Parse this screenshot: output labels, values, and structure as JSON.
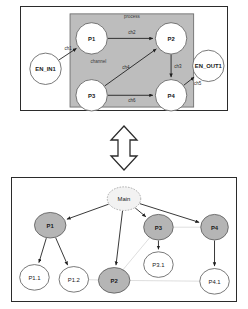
{
  "top_diagram": {
    "name": "process-channel-diagram",
    "region_labels": [
      {
        "id": "process",
        "text": "process",
        "x": 112,
        "y": 10
      },
      {
        "id": "channel",
        "text": "channel",
        "x": 78,
        "y": 56
      }
    ],
    "nodes": [
      {
        "id": "EN_IN1",
        "label": "EN_IN1",
        "x": 24,
        "y": 63,
        "r": 16,
        "style": "white"
      },
      {
        "id": "P1",
        "label": "P1",
        "x": 71,
        "y": 32,
        "r": 16,
        "style": "white"
      },
      {
        "id": "P2",
        "label": "P2",
        "x": 152,
        "y": 32,
        "r": 16,
        "style": "white"
      },
      {
        "id": "P3",
        "label": "P3",
        "x": 71,
        "y": 90,
        "r": 16,
        "style": "white"
      },
      {
        "id": "P4",
        "label": "P4",
        "x": 152,
        "y": 90,
        "r": 16,
        "style": "white"
      },
      {
        "id": "EN_OUT1",
        "label": "EN_OUT1",
        "x": 190,
        "y": 60,
        "r": 16,
        "style": "white"
      }
    ],
    "edges": [
      {
        "id": "ch1",
        "label": "ch1",
        "from": "EN_IN1",
        "to": "P1",
        "lx": 47,
        "ly": 42
      },
      {
        "id": "ch2",
        "label": "ch2",
        "from": "P1",
        "to": "P2",
        "lx": 112,
        "ly": 26
      },
      {
        "id": "ch3",
        "label": "ch3",
        "from": "P2",
        "to": "P4",
        "lx": 159,
        "ly": 61
      },
      {
        "id": "ch4",
        "label": "ch4",
        "from": "P3",
        "to": "P2",
        "lx": 106,
        "ly": 62
      },
      {
        "id": "ch5",
        "label": "ch5",
        "from": "P4",
        "to": "EN_OUT1",
        "lx": 179,
        "ly": 78
      },
      {
        "id": "ch6",
        "label": "ch6",
        "from": "P3",
        "to": "P4",
        "lx": 112,
        "ly": 95
      }
    ]
  },
  "transition_arrow": {
    "name": "bidirectional-arrow",
    "direction": "vertical-double"
  },
  "bottom_diagram": {
    "name": "process-hierarchy-tree",
    "nodes": [
      {
        "id": "Main",
        "label": "Main",
        "x": 113,
        "y": 21,
        "rx": 17,
        "ry": 12,
        "style": "dashed"
      },
      {
        "id": "P1",
        "label": "P1",
        "x": 38,
        "y": 48,
        "rx": 16,
        "ry": 13,
        "style": "gray"
      },
      {
        "id": "P3",
        "label": "P3",
        "x": 148,
        "y": 50,
        "rx": 15,
        "ry": 13,
        "style": "gray"
      },
      {
        "id": "P4",
        "label": "P4",
        "x": 205,
        "y": 50,
        "rx": 14,
        "ry": 13,
        "style": "gray"
      },
      {
        "id": "P1.1",
        "label": "P1.1",
        "x": 22,
        "y": 101,
        "rx": 15,
        "ry": 13,
        "style": "white"
      },
      {
        "id": "P1.2",
        "label": "P1.2",
        "x": 62,
        "y": 103,
        "rx": 15,
        "ry": 13,
        "style": "white"
      },
      {
        "id": "P2",
        "label": "P2",
        "x": 103,
        "y": 104,
        "rx": 16,
        "ry": 13,
        "style": "gray"
      },
      {
        "id": "P3.1",
        "label": "P3.1",
        "x": 148,
        "y": 88,
        "rx": 15,
        "ry": 13,
        "style": "white"
      },
      {
        "id": "P4.1",
        "label": "P4.1",
        "x": 205,
        "y": 105,
        "rx": 15,
        "ry": 13,
        "style": "white"
      }
    ],
    "tree_edges": [
      {
        "from": "Main",
        "to": "P1"
      },
      {
        "from": "Main",
        "to": "P2"
      },
      {
        "from": "Main",
        "to": "P3"
      },
      {
        "from": "Main",
        "to": "P4"
      },
      {
        "from": "P1",
        "to": "P1.1"
      },
      {
        "from": "P1",
        "to": "P1.2"
      },
      {
        "from": "P3",
        "to": "P3.1"
      },
      {
        "from": "P4",
        "to": "P4.1"
      }
    ],
    "link_edges": [
      {
        "from": "P1.2",
        "to": "P2"
      },
      {
        "from": "P2",
        "to": "P3"
      },
      {
        "from": "P3",
        "to": "P4"
      },
      {
        "from": "P2",
        "to": "P4.1"
      }
    ]
  },
  "colors": {
    "node_gray": "#b5b5b5",
    "node_white": "#ffffff",
    "process_box": "#bdbdbd",
    "stroke": "#1f1f1f",
    "faint_link": "#cfcfcf"
  }
}
